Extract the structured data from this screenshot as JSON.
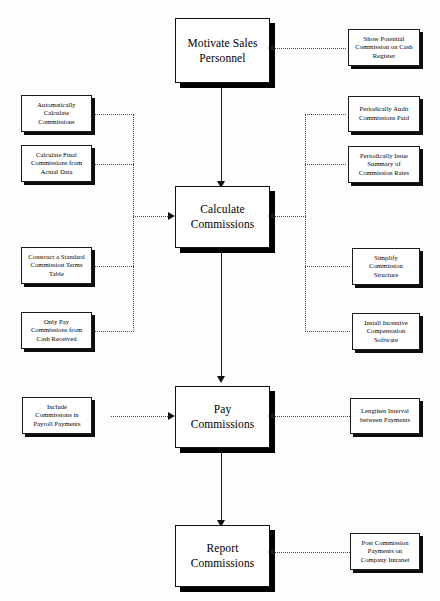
{
  "diagram": {
    "colors": {
      "background": "#fdfdfc",
      "box_fill": "#ffffff",
      "box_border": "#1a1a1a",
      "shadow": "#111111",
      "connector_solid": "#1c1c1c",
      "connector_dotted": "#4a4a4a"
    },
    "process_steps": [
      {
        "id": "motivate",
        "label": "Motivate Sales\nPersonnel"
      },
      {
        "id": "calculate",
        "label": "Calculate\nCommissions"
      },
      {
        "id": "pay",
        "label": "Pay\nCommissions"
      },
      {
        "id": "report",
        "label": "Report\nCommissions"
      }
    ],
    "improvements_left": [
      {
        "id": "auto-calc",
        "label": "Automatically\nCalculate\nCommissions",
        "attaches_to": "calculate"
      },
      {
        "id": "final-actual",
        "label": "Calculate Final\nCommissions from\nActual Data",
        "attaches_to": "calculate"
      },
      {
        "id": "standard-terms",
        "label": "Construct a Standard\nCommission Terms\nTable",
        "attaches_to": "calculate"
      },
      {
        "id": "cash-received",
        "label": "Only Pay\nCommissions from\nCash Received",
        "attaches_to": "calculate"
      },
      {
        "id": "payroll",
        "label": "Include\nCommissions in\nPayroll Payments",
        "attaches_to": "pay"
      }
    ],
    "improvements_right": [
      {
        "id": "cash-register",
        "label": "Show Potential\nCommission on Cash\nRegister",
        "attaches_to": "motivate"
      },
      {
        "id": "audit",
        "label": "Periodically Audit\nCommissions Paid",
        "attaches_to": "calculate"
      },
      {
        "id": "summary-rates",
        "label": "Periodically Issue\nSummary of\nCommission Rates",
        "attaches_to": "calculate"
      },
      {
        "id": "simplify",
        "label": "Simplify\nCommission\nStructure",
        "attaches_to": "calculate"
      },
      {
        "id": "incentive-software",
        "label": "Install Incentive\nCompensation\nSoftware",
        "attaches_to": "calculate"
      },
      {
        "id": "lengthen",
        "label": "Lengthen Interval\nbetween Payments",
        "attaches_to": "pay"
      },
      {
        "id": "intranet",
        "label": "Post Commission\nPayments on\nCompany Intranet",
        "attaches_to": "report"
      }
    ]
  }
}
